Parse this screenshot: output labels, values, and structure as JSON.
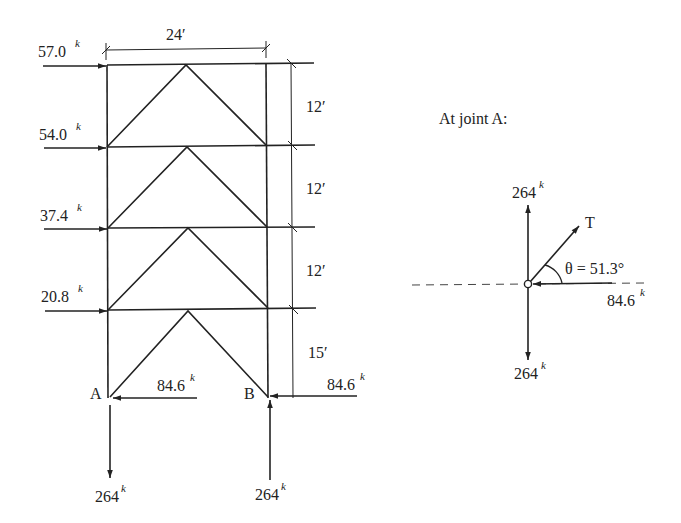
{
  "frame": {
    "width_label": "24′",
    "story_heights": [
      "12′",
      "12′",
      "12′",
      "15′"
    ],
    "lateral_loads": [
      {
        "value": "57.0",
        "unit": "k"
      },
      {
        "value": "54.0",
        "unit": "k"
      },
      {
        "value": "37.4",
        "unit": "k"
      },
      {
        "value": "20.8",
        "unit": "k"
      }
    ],
    "support_A": {
      "label": "A",
      "horizontal": "84.6",
      "vertical": "264",
      "unit": "k"
    },
    "support_B": {
      "label": "B",
      "horizontal": "84.6",
      "vertical": "264",
      "unit": "k"
    }
  },
  "joint_diagram": {
    "title": "At joint A:",
    "up_force": "264",
    "down_force": "264",
    "horizontal_force": "84.6",
    "tension_label": "T",
    "angle_label": "θ = 51.3°",
    "unit": "k"
  }
}
